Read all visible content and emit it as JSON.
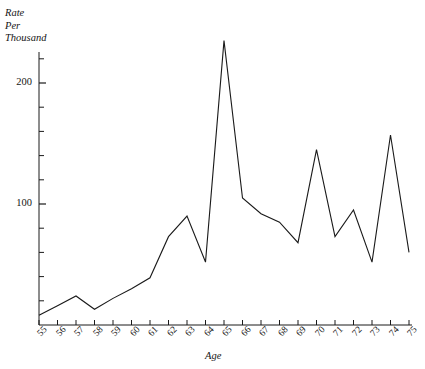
{
  "chart_data": {
    "type": "line",
    "title": "",
    "xlabel": "Age",
    "ylabel": "Rate\nPer\nThousand",
    "ylabel_lines": [
      "Rate",
      "Per",
      "Thousand"
    ],
    "x": [
      55,
      56,
      57,
      58,
      59,
      60,
      61,
      62,
      63,
      64,
      65,
      66,
      67,
      68,
      69,
      70,
      71,
      72,
      73,
      74,
      75
    ],
    "values": [
      8,
      16,
      24,
      13,
      22,
      30,
      39,
      73,
      90,
      52,
      235,
      105,
      92,
      85,
      68,
      145,
      73,
      95,
      52,
      157,
      60
    ],
    "categories": [
      "55",
      "56",
      "57",
      "58",
      "59",
      "60",
      "61",
      "62",
      "63",
      "64",
      "65",
      "66",
      "67",
      "68",
      "69",
      "70",
      "71",
      "72",
      "73",
      "74",
      "75"
    ],
    "xlim": [
      55,
      75
    ],
    "ylim": [
      0,
      248
    ],
    "ytick_values": [
      100,
      200
    ],
    "ytick_labels": [
      "100",
      "200"
    ],
    "yminor_step": 20,
    "grid": false,
    "legend": null,
    "line_color": "#1a1a1a",
    "axis_color": "#1a1a1a",
    "background": "#ffffff"
  },
  "axes": {
    "y_axis_label": "Rate Per Thousand",
    "x_axis_label": "Age"
  }
}
